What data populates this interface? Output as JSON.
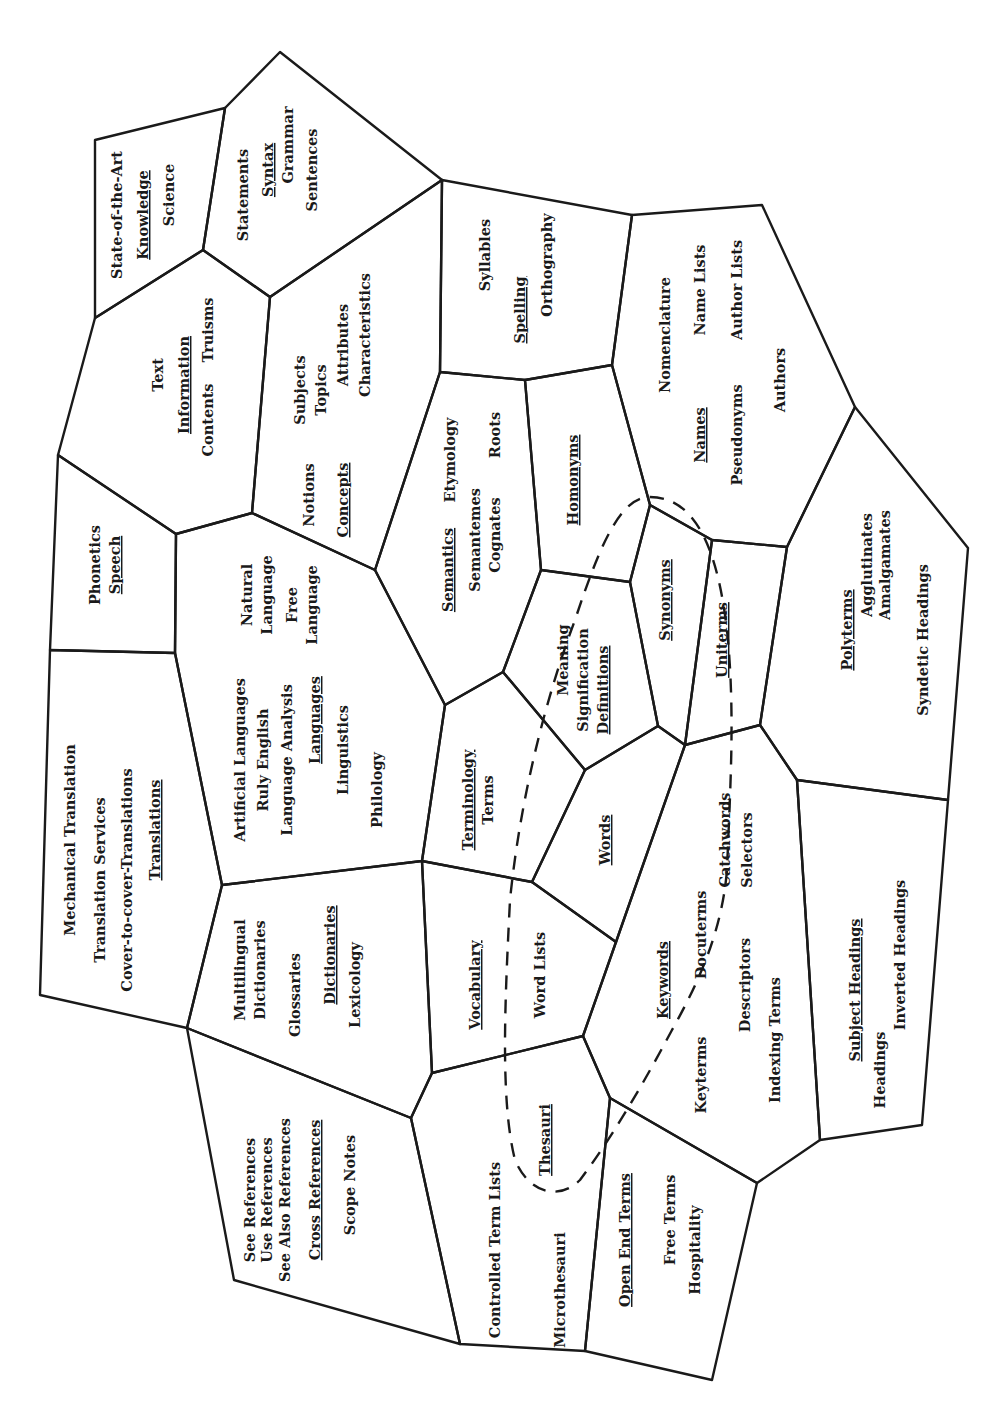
{
  "diagram": {
    "title": "",
    "orientation": "rotated-90-ccw",
    "line_color": "#1a1a1a",
    "background": "#ffffff",
    "regions": [
      {
        "id": "knowledge",
        "heading": "Knowledge",
        "terms": [
          "State-of-the-Art",
          "Science"
        ]
      },
      {
        "id": "syntax",
        "heading": "Syntax",
        "terms": [
          "Statements",
          "Grammar",
          "Sentences"
        ]
      },
      {
        "id": "information",
        "heading": "Information",
        "terms": [
          "Text",
          "Contents",
          "Truisms"
        ]
      },
      {
        "id": "concepts",
        "heading": "Concepts",
        "terms": [
          "Subjects",
          "Topics",
          "Attributes",
          "Characteristics",
          "Notions"
        ]
      },
      {
        "id": "spelling",
        "heading": "Spelling",
        "terms": [
          "Syllables",
          "Orthography"
        ]
      },
      {
        "id": "names",
        "heading": "Names",
        "terms": [
          "Nomenclature",
          "Name Lists",
          "Author Lists",
          "Authors",
          "Pseudonyms"
        ]
      },
      {
        "id": "speech",
        "heading": "Speech",
        "terms": [
          "Phonetics"
        ]
      },
      {
        "id": "semantics",
        "heading": "Semantics",
        "terms": [
          "Etymology",
          "Semantemes",
          "Cognates",
          "Roots"
        ]
      },
      {
        "id": "homonyms",
        "heading": "Homonyms",
        "terms": []
      },
      {
        "id": "languages",
        "heading": "Languages",
        "terms": [
          "Natural Language",
          "Free Language",
          "Artificial Languages",
          "Ruly English",
          "Language Analysis",
          "Linguistics",
          "Philology"
        ]
      },
      {
        "id": "definitions",
        "heading": "Definitions",
        "terms": [
          "Meaning",
          "Signification"
        ]
      },
      {
        "id": "synonyms",
        "heading": "Synonyms",
        "terms": []
      },
      {
        "id": "uniterms",
        "heading": "Uniterms",
        "terms": []
      },
      {
        "id": "polyterms",
        "heading": "Polyterms",
        "terms": [
          "Agglutinates",
          "Amalgamates",
          "Syndetic Headings"
        ]
      },
      {
        "id": "translations",
        "heading": "Translations",
        "terms": [
          "Mechanical Translation",
          "Translation Services",
          "Cover-to-cover-Translations"
        ]
      },
      {
        "id": "terminology",
        "heading": "Terminology",
        "terms": [
          "Terms"
        ]
      },
      {
        "id": "words",
        "heading": "Words",
        "terms": []
      },
      {
        "id": "dictionaries",
        "heading": "Dictionaries",
        "terms": [
          "Multilingual Dictionaries",
          "Glossaries",
          "Lexicology"
        ]
      },
      {
        "id": "vocabulary",
        "heading": "Vocabulary",
        "terms": [
          "Word Lists"
        ]
      },
      {
        "id": "keywords",
        "heading": "Keywords",
        "terms": [
          "Catchwords",
          "Selectors",
          "Docuterms",
          "Descriptors",
          "Keyterms",
          "Indexing Terms"
        ]
      },
      {
        "id": "subject_headings",
        "heading": "Subject Headings",
        "terms": [
          "Inverted Headings",
          "Headings"
        ]
      },
      {
        "id": "cross_references",
        "heading": "Cross References",
        "terms": [
          "See References",
          "Use References",
          "See Also References",
          "Scope Notes"
        ]
      },
      {
        "id": "thesauri",
        "heading": "Thesauri",
        "terms": [
          "Controlled Term Lists",
          "Microthesauri"
        ]
      },
      {
        "id": "open_end_terms",
        "heading": "Open End Terms",
        "terms": [
          "Free Terms",
          "Hospitality"
        ]
      }
    ],
    "dashed_loop": {
      "encloses": [
        "definitions",
        "synonyms",
        "uniterms",
        "terminology",
        "vocabulary",
        "thesauri",
        "keywords"
      ]
    }
  },
  "labels": {
    "knowledge": {
      "t1": "State-of-the-Art",
      "h": "Knowledge",
      "t2": "Science"
    },
    "syntax": {
      "t1": "Statements",
      "h": "Syntax",
      "t2": "Grammar",
      "t3": "Sentences"
    },
    "information": {
      "t1": "Text",
      "h": "Information",
      "t2": "Contents",
      "t3": "Truisms"
    },
    "concepts": {
      "t1": "Subjects",
      "t2": "Topics",
      "t3": "Attributes",
      "t4": "Characteristics",
      "t5": "Notions",
      "h": "Concepts"
    },
    "spelling": {
      "t1": "Syllables",
      "h": "Spelling",
      "t2": "Orthography"
    },
    "names": {
      "t1": "Nomenclature",
      "t2": "Name Lists",
      "t3": "Author Lists",
      "t4": "Authors",
      "h": "Names",
      "t5": "Pseudonyms"
    },
    "speech": {
      "t1": "Phonetics",
      "h": "Speech"
    },
    "semantics": {
      "h": "Semantics",
      "t1": "Etymology",
      "t2": "Semantemes",
      "t3": "Cognates",
      "t4": "Roots"
    },
    "homonyms": {
      "h": "Homonyms"
    },
    "languages": {
      "t1": "Natural",
      "t2": "Language",
      "t3": "Free",
      "t4": "Language",
      "t5": "Artificial Languages",
      "t6": "Ruly English",
      "t7": "Language Analysis",
      "h": "Languages",
      "t8": "Linguistics",
      "t9": "Philology"
    },
    "definitions": {
      "t1": "Meaning",
      "t2": "Signification",
      "h": "Definitions"
    },
    "synonyms": {
      "h": "Synonyms"
    },
    "uniterms": {
      "h": "Uniterms"
    },
    "polyterms": {
      "h": "Polyterms",
      "t1": "Agglutinates",
      "t2": "Amalgamates",
      "t3": "Syndetic Headings"
    },
    "translations": {
      "t1": "Mechanical Translation",
      "t2": "Translation Services",
      "t3": "Cover-to-cover-Translations",
      "h": "Translations"
    },
    "terminology": {
      "h": "Terminology",
      "t1": "Terms"
    },
    "words": {
      "h": "Words"
    },
    "dictionaries": {
      "t1": "Multilingual",
      "t2": "Dictionaries",
      "t3": "Glossaries",
      "h": "Dictionaries",
      "t4": "Lexicology"
    },
    "vocabulary": {
      "h": "Vocabulary",
      "t1": "Word Lists"
    },
    "keywords": {
      "t1": "Catchwords",
      "t2": "Selectors",
      "h": "Keywords",
      "t3": "Docuterms",
      "t4": "Descriptors",
      "t5": "Keyterms",
      "t6": "Indexing Terms"
    },
    "subject_headings": {
      "h": "Subject Headings",
      "t1": "Inverted Headings",
      "t2": "Headings"
    },
    "cross_references": {
      "t1": "See References",
      "t2": "Use References",
      "t3": "See Also References",
      "h": "Cross References",
      "t4": "Scope Notes"
    },
    "thesauri": {
      "t1": "Controlled Term Lists",
      "h": "Thesauri",
      "t2": "Microthesauri"
    },
    "open_end_terms": {
      "h": "Open End Terms",
      "t1": "Free Terms",
      "t2": "Hospitality"
    }
  }
}
